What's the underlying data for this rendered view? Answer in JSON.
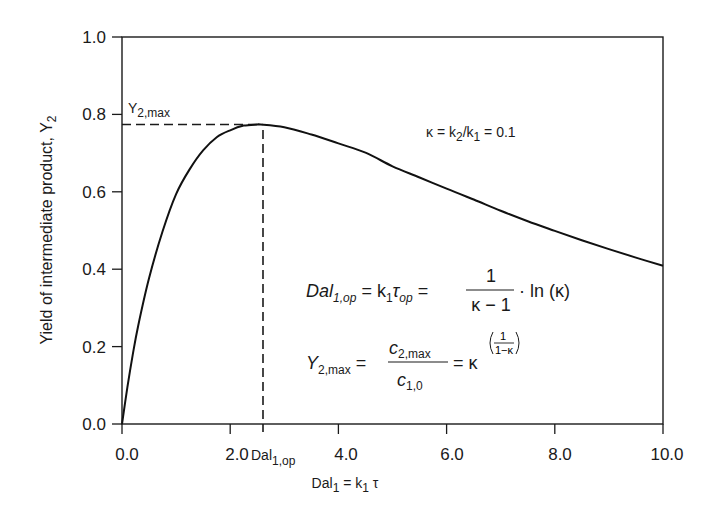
{
  "chart_data": {
    "type": "line",
    "title": "",
    "xlabel": "Dal1 = k1 τ",
    "ylabel": "Yield of intermediate product, Y2",
    "xlim": [
      0,
      10
    ],
    "ylim": [
      0,
      1
    ],
    "x_ticks": [
      "0.0",
      "2.0",
      "4.0",
      "6.0",
      "8.0",
      "10.0"
    ],
    "y_ticks": [
      "0.0",
      "0.2",
      "0.4",
      "0.6",
      "0.8",
      "1.0"
    ],
    "grid": false,
    "legend": "none",
    "series": [
      {
        "name": "Y2 (κ = 0.1)",
        "x": [
          0,
          0.1,
          0.2,
          0.3,
          0.5,
          0.75,
          1.0,
          1.25,
          1.5,
          1.75,
          2.0,
          2.25,
          2.5,
          2.56,
          3.0,
          3.5,
          4.0,
          4.5,
          5.0,
          5.5,
          6.0,
          6.5,
          7.0,
          7.5,
          8.0,
          8.5,
          9.0,
          9.5,
          10.0
        ],
        "values": [
          0,
          0.095,
          0.18,
          0.254,
          0.377,
          0.498,
          0.594,
          0.658,
          0.707,
          0.741,
          0.759,
          0.771,
          0.774,
          0.774,
          0.767,
          0.748,
          0.725,
          0.701,
          0.666,
          0.637,
          0.608,
          0.58,
          0.551,
          0.524,
          0.499,
          0.475,
          0.452,
          0.43,
          0.409
        ]
      }
    ],
    "annotations": {
      "peak_marker": {
        "x": 2.56,
        "y": 0.774,
        "style": "dashed"
      },
      "y2max_label": "Y2,max",
      "dalop_label": "Dal1,op",
      "kappa_text": "κ = k2/k1 = 0.1",
      "equation_1": "Dal1,op = k1 τop = 1/(κ − 1) · ln (κ)",
      "equation_2": "Y2,max = c2,max / c1,0 = κ^(1/(1−κ))"
    }
  },
  "labels": {
    "y_axis_main": "Yield of intermediate product, Y",
    "y_axis_sub": "2",
    "x_axis_main": "Dal",
    "x_axis_sub1": "1",
    "x_axis_mid": " = k",
    "x_axis_sub2": "1",
    "x_axis_tail": " τ",
    "ymax_main": "Y",
    "ymax_sub": "2,max",
    "dalop_main": "Dal",
    "dalop_sub": "1,op",
    "kappa_a": "κ = k",
    "kappa_sub1": "2",
    "kappa_b": "/k",
    "kappa_sub2": "1",
    "kappa_c": " = 0.1",
    "eq1_lhs": "Dal",
    "eq1_lhs_sub": "1,op",
    "eq1_mid": " = k",
    "eq1_mid_sub": "1",
    "eq1_tau": "τ",
    "eq1_tau_sub": "op",
    "eq1_eq": " = ",
    "eq1_num": "1",
    "eq1_den": "κ − 1",
    "eq1_tail": "· ln (κ)",
    "eq2_lhs": "Y",
    "eq2_lhs_sub": "2,max",
    "eq2_eq": " = ",
    "eq2_num": "c",
    "eq2_num_sub": "2,max",
    "eq2_den": "c",
    "eq2_den_sub": "1,0",
    "eq2_rhs": "= κ",
    "eq2_exp_num": "1",
    "eq2_exp_den": "1−κ"
  },
  "ticks": {
    "x": [
      "0.0",
      "2.0",
      "4.0",
      "6.0",
      "8.0",
      "10.0"
    ],
    "y": [
      "0.0",
      "0.2",
      "0.4",
      "0.6",
      "0.8",
      "1.0"
    ]
  }
}
